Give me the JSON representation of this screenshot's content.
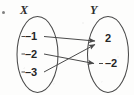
{
  "figure": {
    "kind": "mapping-diagram",
    "corner_marker": "•",
    "stroke_color": "#4a4a4a",
    "text_color": "#262626",
    "background_color": "#fdfdfc"
  },
  "domain_set": {
    "label": "X",
    "elements": [
      {
        "value": "–1",
        "dash": "–",
        "number": "1"
      },
      {
        "value": "–2",
        "dash": "–",
        "number": "2"
      },
      {
        "value": "–3",
        "dash": "–",
        "number": "3"
      }
    ]
  },
  "range_set": {
    "label": "Y",
    "elements": [
      {
        "value": "2",
        "number": "2"
      },
      {
        "value": "–2",
        "dash": "–",
        "number": "2"
      }
    ]
  },
  "mappings": [
    {
      "from": "–1",
      "to": "2",
      "description": "negative-one-maps-to-two"
    },
    {
      "from": "–2",
      "to": "–2",
      "description": "negative-two-maps-to-negative-two"
    },
    {
      "from": "–3",
      "to": "2",
      "description": "negative-three-maps-to-two"
    }
  ]
}
